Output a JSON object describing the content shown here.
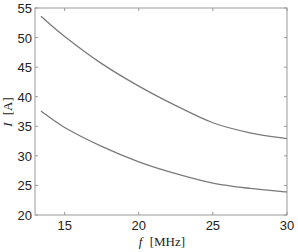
{
  "chart_data": {
    "type": "line",
    "title": "",
    "xlabel_var": "f",
    "xlabel_unit": "[MHz]",
    "ylabel_var": "I",
    "ylabel_unit": "[A]",
    "xlim": [
      13,
      30
    ],
    "ylim": [
      20,
      55
    ],
    "xticks": [
      15,
      20,
      25,
      30
    ],
    "yticks": [
      20,
      25,
      30,
      35,
      40,
      45,
      50,
      55
    ],
    "grid": false,
    "line_color": "#7a7a7a",
    "series": [
      {
        "name": "upper",
        "x": [
          13.4,
          15,
          17.5,
          20,
          22.5,
          25,
          27.5,
          30
        ],
        "y": [
          53.6,
          50.2,
          45.6,
          41.8,
          38.5,
          35.6,
          33.9,
          32.9
        ]
      },
      {
        "name": "lower",
        "x": [
          13.4,
          15,
          17.5,
          20,
          22.5,
          25,
          27.5,
          30
        ],
        "y": [
          37.6,
          34.8,
          31.6,
          29.0,
          27.0,
          25.4,
          24.5,
          23.9
        ]
      }
    ]
  }
}
